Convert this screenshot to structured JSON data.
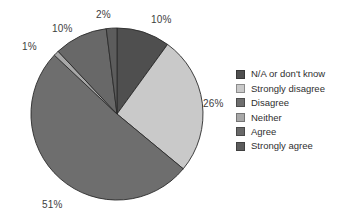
{
  "chart_data": {
    "type": "pie",
    "title": "",
    "subtitle": "",
    "xlabel": "",
    "ylabel": "",
    "grid": false,
    "legend_position": "right",
    "start_angle_deg": 0,
    "direction": "clockwise",
    "center": {
      "x": 117,
      "y": 114
    },
    "radius": 86,
    "categories": [
      "N/A or don't know",
      "Strongly disagree",
      "Disagree",
      "Neither",
      "Agree",
      "Strongly agree"
    ],
    "values": [
      10,
      26,
      51,
      1,
      10,
      2
    ],
    "value_labels": [
      "10%",
      "26%",
      "51%",
      "1%",
      "10%",
      "2%"
    ],
    "colors": [
      "#4f4f4f",
      "#c9c9c9",
      "#6e6e6e",
      "#a8a8a8",
      "#686868",
      "#5c5c5c"
    ],
    "slice_outline_color": "#2b2b2b",
    "background_color": "#ffffff"
  },
  "slice_labels": [
    {
      "text": "10%",
      "left": 151,
      "top": 15
    },
    {
      "text": "26%",
      "left": 203,
      "top": 99
    },
    {
      "text": "51%",
      "left": 42,
      "top": 200
    },
    {
      "text": "1%",
      "left": 22,
      "top": 42
    },
    {
      "text": "10%",
      "left": 52,
      "top": 24
    },
    {
      "text": "2%",
      "left": 96,
      "top": 10
    }
  ],
  "legend": {
    "items": [
      {
        "label": "N/A or don't know",
        "color": "#4f4f4f"
      },
      {
        "label": "Strongly disagree",
        "color": "#c9c9c9"
      },
      {
        "label": "Disagree",
        "color": "#6e6e6e"
      },
      {
        "label": "Neither",
        "color": "#a8a8a8"
      },
      {
        "label": "Agree",
        "color": "#686868"
      },
      {
        "label": "Strongly agree",
        "color": "#5c5c5c"
      }
    ]
  }
}
